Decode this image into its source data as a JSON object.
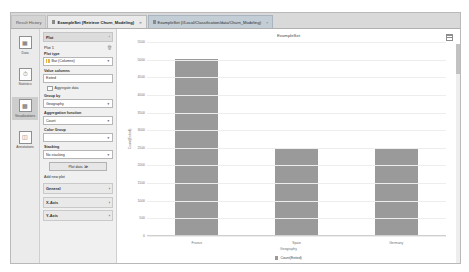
{
  "tabs": [
    {
      "label": "Result History",
      "icon": "",
      "closable": false,
      "state": "plain"
    },
    {
      "label": "ExampleSet (Retrieve Churn_Modeling)",
      "icon": "table-icon",
      "closable": true,
      "state": "active"
    },
    {
      "label": "ExampleSet (//Local/Classification/data/Churn_Modeling)",
      "icon": "table-icon",
      "closable": true,
      "state": "sel"
    }
  ],
  "rail": [
    {
      "label": "Data",
      "icon": "table-grid-icon",
      "active": false
    },
    {
      "label": "Statistics",
      "icon": "funnel-icon",
      "active": false
    },
    {
      "label": "Visualizations",
      "icon": "chart-icon",
      "active": true
    },
    {
      "label": "Annotations",
      "icon": "note-icon",
      "active": false
    }
  ],
  "panel": {
    "section_title": "Plot",
    "section_chevron": "‹",
    "plot_name": "Plot 1",
    "delete_icon": "trash-icon",
    "plot_type_label": "Plot type",
    "plot_type_value": "Bar (Columns)",
    "value_columns_label": "Value columns",
    "value_columns_value": "Exited",
    "aggregate_label": "Aggregate data",
    "group_by_label": "Group by",
    "group_by_value": "Geography",
    "aggregation_label": "Aggregation function",
    "aggregation_value": "Count",
    "color_group_label": "Color Group",
    "color_group_value": "",
    "stacking_label": "Stacking",
    "stacking_value": "No stacking",
    "plot_data_button": "Plot data ≫",
    "add_plot_link": "Add new plot",
    "collapsed_sections": [
      {
        "label": "General",
        "chevron": "›"
      },
      {
        "label": "X-Axis",
        "chevron": "›"
      },
      {
        "label": "Y-Axis",
        "chevron": "›"
      }
    ]
  },
  "chart_toolbar": {
    "grid_icon": "grid-toggle-icon"
  },
  "chart_data": {
    "type": "bar",
    "title": "ExampleSet",
    "categories": [
      "France",
      "Spain",
      "Germany"
    ],
    "values": [
      5014,
      2477,
      2509
    ],
    "series": [
      {
        "name": "Count(Exited)",
        "values": [
          5014,
          2477,
          2509
        ]
      }
    ],
    "xlabel": "Geography",
    "ylabel": "Count(Exited)",
    "ylim": [
      0,
      5500
    ],
    "yticks": [
      5500,
      5000,
      4500,
      4000,
      3500,
      3000,
      2500,
      2000,
      1500,
      1000,
      500,
      0
    ],
    "ytick_labels": [
      "5500",
      "5000",
      "4500",
      "4000",
      "3500",
      "3000",
      "2500",
      "2000",
      "1500",
      "1000",
      "500",
      "0"
    ],
    "grid": true,
    "legend_position": "bottom",
    "legend": [
      "Count(Exited)"
    ],
    "bar_color": "#9a9a9a"
  }
}
